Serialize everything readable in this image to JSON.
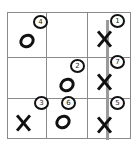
{
  "game": {
    "type": "tic-tac-toe",
    "grid_size": 3,
    "winner": "X",
    "win_line": {
      "orientation": "vertical",
      "column": 3,
      "color": "#9a9a9a"
    },
    "colors": {
      "grid": "#8a8a8a",
      "marks": "#111111",
      "background": "#ffffff"
    }
  },
  "cells": [
    {
      "row": 1,
      "col": 1,
      "mark": "O",
      "move": "4"
    },
    {
      "row": 1,
      "col": 2,
      "mark": "",
      "move": ""
    },
    {
      "row": 1,
      "col": 3,
      "mark": "X",
      "move": "1"
    },
    {
      "row": 2,
      "col": 1,
      "mark": "",
      "move": ""
    },
    {
      "row": 2,
      "col": 2,
      "mark": "O",
      "move": "2"
    },
    {
      "row": 2,
      "col": 3,
      "mark": "X",
      "move": "7"
    },
    {
      "row": 3,
      "col": 1,
      "mark": "X",
      "move": "3"
    },
    {
      "row": 3,
      "col": 2,
      "mark": "O",
      "move": "6"
    },
    {
      "row": 3,
      "col": 3,
      "mark": "X",
      "move": "5"
    }
  ]
}
